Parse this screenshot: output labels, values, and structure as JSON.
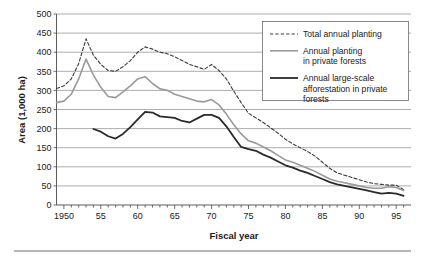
{
  "chart_data": {
    "type": "line",
    "title": "",
    "xlabel": "Fiscal year",
    "ylabel": "Area (1,000 ha)",
    "xlim": [
      1949,
      1997
    ],
    "ylim": [
      0,
      500
    ],
    "ytick_step": 50,
    "xtick_step_minor": 1,
    "xtick_step_major": 5,
    "grid": "horizontal",
    "legend_position": "top-right",
    "x_tick_labels": [
      "1950",
      "55",
      "60",
      "65",
      "70",
      "75",
      "80",
      "85",
      "90",
      "95"
    ],
    "x_tick_values": [
      1950,
      1955,
      1960,
      1965,
      1970,
      1975,
      1980,
      1985,
      1990,
      1995
    ],
    "y_tick_labels": [
      "0",
      "50",
      "100",
      "150",
      "200",
      "250",
      "300",
      "350",
      "400",
      "450",
      "500"
    ],
    "y_tick_values": [
      0,
      50,
      100,
      150,
      200,
      250,
      300,
      350,
      400,
      450,
      500
    ],
    "x": [
      1949,
      1950,
      1951,
      1952,
      1953,
      1954,
      1955,
      1956,
      1957,
      1958,
      1959,
      1960,
      1961,
      1962,
      1963,
      1964,
      1965,
      1966,
      1967,
      1968,
      1969,
      1970,
      1971,
      1972,
      1973,
      1974,
      1975,
      1976,
      1977,
      1978,
      1979,
      1980,
      1981,
      1982,
      1983,
      1984,
      1985,
      1986,
      1987,
      1988,
      1989,
      1990,
      1991,
      1992,
      1993,
      1994,
      1995,
      1996
    ],
    "series": [
      {
        "name": "Total annual planting",
        "style": "dashed",
        "color": "#3a3a3a",
        "width": 1.1,
        "values": [
          305,
          312,
          330,
          370,
          435,
          392,
          368,
          352,
          350,
          362,
          378,
          400,
          414,
          408,
          400,
          396,
          388,
          378,
          368,
          362,
          355,
          368,
          352,
          330,
          298,
          268,
          240,
          228,
          216,
          202,
          188,
          172,
          160,
          150,
          140,
          128,
          112,
          96,
          84,
          78,
          72,
          66,
          60,
          56,
          54,
          52,
          52,
          40
        ]
      },
      {
        "name": "Annual planting in private forests",
        "style": "solid",
        "color": "#9a9a9a",
        "width": 1.6,
        "values": [
          268,
          272,
          290,
          330,
          382,
          340,
          308,
          284,
          281,
          296,
          312,
          330,
          336,
          318,
          304,
          300,
          290,
          284,
          278,
          272,
          270,
          276,
          262,
          238,
          210,
          186,
          168,
          162,
          152,
          142,
          130,
          118,
          112,
          104,
          96,
          88,
          78,
          68,
          62,
          58,
          54,
          50,
          46,
          44,
          44,
          48,
          46,
          38
        ]
      },
      {
        "name": "Annual large-scale afforestation in private forests",
        "style": "solid",
        "color": "#2a2a2a",
        "width": 1.8,
        "values": [
          null,
          null,
          null,
          null,
          null,
          199,
          192,
          180,
          174,
          186,
          204,
          224,
          244,
          242,
          232,
          230,
          228,
          220,
          216,
          226,
          236,
          236,
          228,
          206,
          178,
          152,
          146,
          142,
          132,
          124,
          114,
          104,
          98,
          90,
          84,
          76,
          68,
          60,
          54,
          50,
          46,
          42,
          38,
          34,
          30,
          32,
          30,
          24
        ]
      }
    ],
    "legend_entries": [
      {
        "label_lines": [
          "Total annual planting"
        ],
        "style": "dashed",
        "color": "#3a3a3a"
      },
      {
        "label_lines": [
          "Annual planting",
          "in private forests"
        ],
        "style": "solid",
        "color": "#9a9a9a"
      },
      {
        "label_lines": [
          "Annual large-scale",
          "afforestation in private",
          "forests"
        ],
        "style": "solid",
        "color": "#2a2a2a"
      }
    ]
  }
}
